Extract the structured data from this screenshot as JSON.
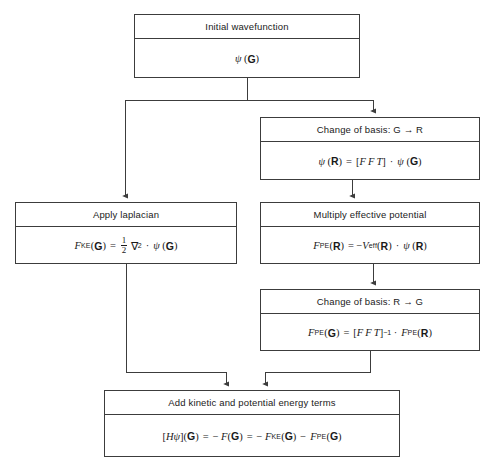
{
  "diagram": {
    "type": "flowchart",
    "line_color": "#3c3c3c",
    "background": "#ffffff",
    "nodes": [
      {
        "id": "initial",
        "title": "Initial wavefunction",
        "formula_text": "ψ(G)",
        "x": 134,
        "y": 14,
        "w": 226,
        "h": 64
      },
      {
        "id": "basis_g_to_r",
        "title": "Change of basis: G → R",
        "formula_text": "ψ(R) = [F F T] · ψ(G)",
        "x": 260,
        "y": 117,
        "w": 220,
        "h": 63
      },
      {
        "id": "laplacian",
        "title": "Apply laplacian",
        "formula_text": "F_KE(G) = ½ ∇² · ψ(G)",
        "x": 15,
        "y": 202,
        "w": 222,
        "h": 62
      },
      {
        "id": "potential",
        "title": "Multiply effective potential",
        "formula_text": "F_PE(R) = −V_eff(R) · ψ(R)",
        "x": 260,
        "y": 202,
        "w": 220,
        "h": 62
      },
      {
        "id": "basis_r_to_g",
        "title": "Change of basis: R → G",
        "formula_text": "F_PE(G) = [F F T]⁻¹ · F_PE(R)",
        "x": 260,
        "y": 289,
        "w": 220,
        "h": 62
      },
      {
        "id": "add_terms",
        "title": "Add kinetic and potential energy terms",
        "formula_text": "[Hψ](G) = − F(G) = − F_KE(G) − F_PE(G)",
        "x": 104,
        "y": 390,
        "w": 296,
        "h": 67
      }
    ],
    "connectors": [
      {
        "from": "initial",
        "to": "bus",
        "kind": "line"
      },
      {
        "from": "bus",
        "to": "laplacian",
        "kind": "arrow"
      },
      {
        "from": "bus",
        "to": "basis_g_to_r",
        "kind": "arrow"
      },
      {
        "from": "basis_g_to_r",
        "to": "potential",
        "kind": "arrow"
      },
      {
        "from": "potential",
        "to": "basis_r_to_g",
        "kind": "arrow"
      },
      {
        "from": "laplacian",
        "to": "add_terms",
        "kind": "arrow"
      },
      {
        "from": "basis_r_to_g",
        "to": "add_terms",
        "kind": "arrow"
      }
    ]
  }
}
